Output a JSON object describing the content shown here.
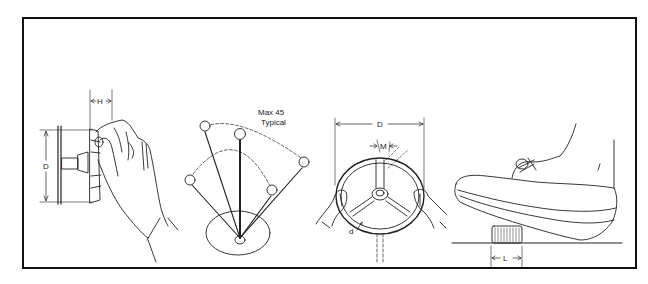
{
  "figure": {
    "colors": {
      "ink": "#222222",
      "frame": "#111111",
      "background": "#ffffff"
    }
  },
  "panels": [
    {
      "id": "knob",
      "name": "Rotary knob grasped by fingertips",
      "dimension_labels": {
        "height": "H",
        "diameter": "D"
      }
    },
    {
      "id": "lever",
      "name": "Ball-top lever with swing arc",
      "annotation_line1": "Max 45",
      "annotation_line2": "Typical"
    },
    {
      "id": "handwheel",
      "name": "Handwheel grasped with two hands",
      "dimension_labels": {
        "diameter": "D",
        "rim_thickness": "d",
        "handle_width": "M"
      }
    },
    {
      "id": "pedal",
      "name": "Foot-operated push button",
      "dimension_labels": {
        "length": "L"
      }
    }
  ]
}
